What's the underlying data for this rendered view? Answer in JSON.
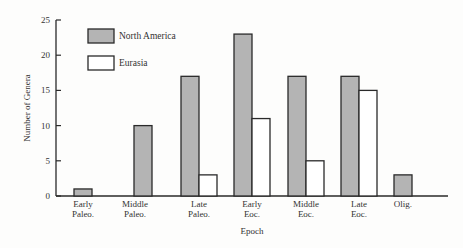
{
  "chart_data": {
    "type": "bar",
    "title": "",
    "xlabel": "Epoch",
    "ylabel": "Number of Genera",
    "ylim": [
      0,
      25
    ],
    "yticks": [
      0,
      5,
      10,
      15,
      20,
      25
    ],
    "grid": false,
    "legend_position": "upper-left",
    "categories": [
      [
        "Early",
        "Paleo."
      ],
      [
        "Middle",
        "Paleo."
      ],
      [
        "Late",
        "Paleo."
      ],
      [
        "Early",
        "Eoc."
      ],
      [
        "Middle",
        "Eoc."
      ],
      [
        "Late",
        "Eoc."
      ],
      [
        "Olig."
      ]
    ],
    "series": [
      {
        "name": "North America",
        "color": "#b4b4b4",
        "values": [
          1,
          10,
          17,
          23,
          17,
          17,
          3
        ]
      },
      {
        "name": "Eurasia",
        "color": "#ffffff",
        "values": [
          0,
          0,
          3,
          11,
          5,
          15,
          0
        ]
      }
    ]
  },
  "colors": {
    "axis": "#2a2a2a",
    "bar_stroke": "#2a2a2a"
  }
}
